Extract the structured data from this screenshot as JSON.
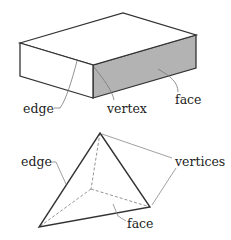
{
  "diagram_data": {
    "figures": [
      {
        "name": "rectangular-prism",
        "labels": {
          "edge": "edge",
          "vertex": "vertex",
          "face": "face"
        },
        "colors": {
          "shaded_face": "#b3b3b3",
          "outline": "#333333",
          "leader": "#777777"
        }
      },
      {
        "name": "tetrahedron",
        "labels": {
          "edge": "edge",
          "vertices": "vertices",
          "face": "face"
        },
        "colors": {
          "outline": "#333333",
          "hidden": "#888888",
          "leader": "#888888"
        }
      }
    ]
  }
}
